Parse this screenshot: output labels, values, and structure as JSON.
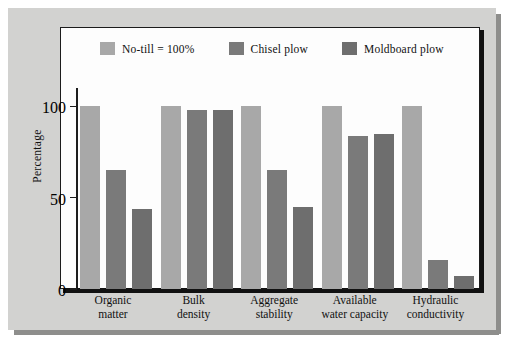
{
  "chart_data": {
    "type": "bar",
    "title": "",
    "subtitle": "",
    "xlabel": "",
    "ylabel": "Percentage",
    "ylim": [
      0,
      110
    ],
    "yticks": [
      0,
      50,
      100
    ],
    "ytick_labels": [
      "0",
      "50",
      "100"
    ],
    "grid": false,
    "legend_position": "top-inside",
    "categories": [
      "Organic matter",
      "Bulk density",
      "Aggregate stability",
      "Available water capacity",
      "Hydraulic conductivity"
    ],
    "category_lines": [
      [
        "Organic",
        "matter"
      ],
      [
        "Bulk",
        "density"
      ],
      [
        "Aggregate",
        "stability"
      ],
      [
        "Available",
        "water capacity"
      ],
      [
        "Hydraulic",
        "conductivity"
      ]
    ],
    "series": [
      {
        "name": "No-till = 100%",
        "color": "#a8a8a8",
        "values": [
          100,
          100,
          100,
          100,
          100
        ]
      },
      {
        "name": "Chisel plow",
        "color": "#7a7a7a",
        "values": [
          65,
          98,
          65,
          84,
          16
        ]
      },
      {
        "name": "Moldboard plow",
        "color": "#6e6e6e",
        "values": [
          44,
          98,
          45,
          85,
          7
        ]
      }
    ]
  },
  "legend": {
    "items": [
      {
        "label": "No-till = 100%",
        "color": "#a8a8a8"
      },
      {
        "label": "Chisel plow",
        "color": "#7a7a7a"
      },
      {
        "label": "Moldboard plow",
        "color": "#6e6e6e"
      }
    ]
  },
  "axes": {
    "y_title": "Percentage",
    "y_ticks": [
      "100",
      "50",
      "0"
    ]
  },
  "colors": {
    "page_background": "#d2d2d0",
    "panel_background": "#fdfdfd",
    "panel_border": "#1c1c1c",
    "axis": "#111111",
    "text": "#111111"
  }
}
